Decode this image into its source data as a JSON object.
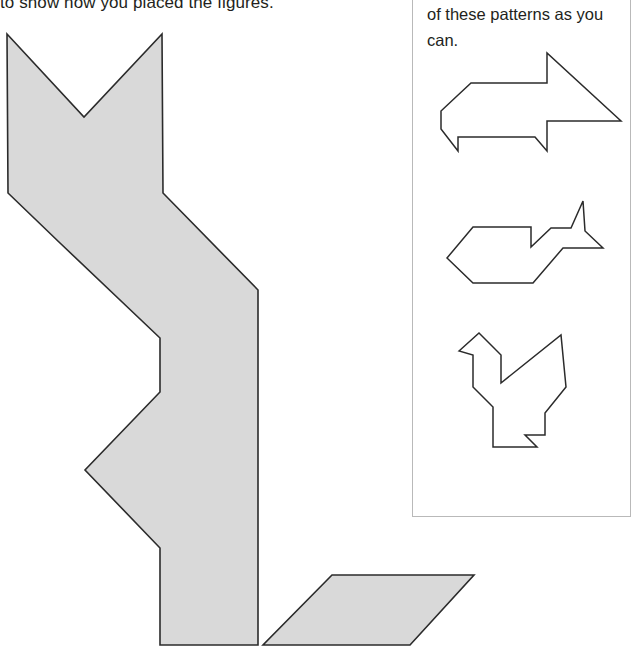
{
  "page": {
    "instruction_text": "to show how you placed the figures.",
    "background_color": "#ffffff"
  },
  "pattern_box": {
    "prompt_text": "of these patterns as you can.",
    "border_color": "#b9b9b9",
    "patterns": [
      {
        "name": "arrow-pattern",
        "label": "arrow pattern"
      },
      {
        "name": "fish-pattern",
        "label": "fish pattern"
      },
      {
        "name": "rooster-pattern",
        "label": "rooster pattern"
      }
    ]
  },
  "main_figure": {
    "name": "assembled-tangram-figure",
    "fill_color": "#d9d9d9",
    "stroke_color": "#2b2b2b",
    "pieces": [
      {
        "name": "large-body-piece"
      },
      {
        "name": "parallelogram-piece"
      }
    ]
  }
}
